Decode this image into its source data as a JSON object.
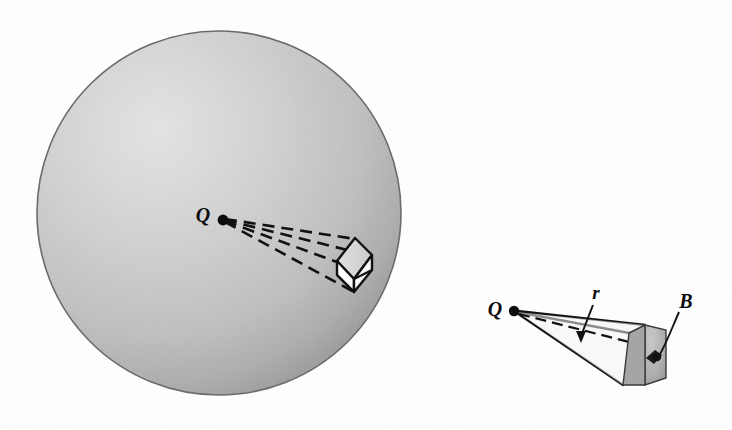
{
  "figure": {
    "title": "Point charge Q at center of sphere with projected solid-angle cone and area element B",
    "background_color": "#fefefe",
    "ink_color": "#0d0d0d"
  },
  "sphere": {
    "name": "shaded-sphere",
    "center_x": 219,
    "center_y": 213,
    "radius": 182,
    "edge_color": "#5a5a5a",
    "highlight_color": "#e2e2e2",
    "midtone_color": "#c6c6c6",
    "shadow_color": "#8e8e8e",
    "light_direction": "upper-left"
  },
  "left_diagram": {
    "name": "sphere-cone-diagram",
    "charge_label": "Q",
    "charge_label_x": 203,
    "charge_label_y": 222,
    "charge_point_x": 223,
    "charge_point_y": 220,
    "charge_dot_radius": 5,
    "cone_line_style": "dashed",
    "box_face_fill": "#ffffff",
    "box_top_fill": "#d6d6d6",
    "box_bottom_fill": "#bdbdbd",
    "cone_rays": [
      {
        "x2": 352,
        "y2": 240
      },
      {
        "x2": 368,
        "y2": 255
      },
      {
        "x2": 338,
        "y2": 262
      },
      {
        "x2": 352,
        "y2": 288
      }
    ]
  },
  "right_diagram": {
    "name": "area-element-detail",
    "charge_label": "Q",
    "charge_label_x": 494,
    "charge_label_y": 315,
    "charge_point_x": 514,
    "charge_point_y": 311,
    "charge_dot_radius": 5,
    "radius_label": "r",
    "radius_label_x": 595,
    "radius_label_y": 296,
    "radius_arrow_tip_x": 581,
    "radius_arrow_tip_y": 341,
    "area_label": "B",
    "area_label_x": 685,
    "area_label_y": 310,
    "axis_line_style": "dashed",
    "cone_line_style": "solid",
    "patch_fill": "#b8b8b8",
    "patch_side_fill": "#a0a0a0",
    "element_marker_fill": "#1a1a1a"
  },
  "labels": [
    {
      "text": "Q",
      "role": "point-charge",
      "diagram": "left"
    },
    {
      "text": "Q",
      "role": "point-charge",
      "diagram": "right"
    },
    {
      "text": "r",
      "role": "radial-distance",
      "diagram": "right"
    },
    {
      "text": "B",
      "role": "area-element",
      "diagram": "right"
    }
  ]
}
